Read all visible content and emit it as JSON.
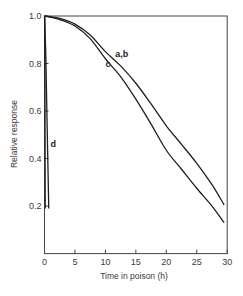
{
  "chart_data": {
    "type": "line",
    "title": "",
    "xlabel": "Time in poison (h)",
    "ylabel": "Relative response",
    "xlim": [
      0,
      30
    ],
    "ylim": [
      0,
      1.0
    ],
    "xticks": [
      0,
      5,
      10,
      15,
      20,
      25,
      30
    ],
    "xtick_labels": [
      "0",
      "5",
      "10",
      "15",
      "20",
      "25",
      "30"
    ],
    "yticks": [
      0.2,
      0.4,
      0.6,
      0.8,
      1.0
    ],
    "ytick_labels": [
      "0.2",
      "0.4",
      "0.6",
      "0.8",
      "1.0"
    ],
    "grid": false,
    "legend": "none (curves labelled inline)",
    "series": [
      {
        "name": "a,b",
        "x": [
          0,
          2.5,
          5,
          7.5,
          10,
          12.5,
          15,
          17.5,
          20,
          22.5,
          25,
          27.5,
          29.5
        ],
        "values": [
          1.0,
          0.99,
          0.966,
          0.92,
          0.85,
          0.79,
          0.717,
          0.63,
          0.538,
          0.46,
          0.38,
          0.29,
          0.205
        ],
        "label_pos": {
          "x": 11.6,
          "y": 0.84
        }
      },
      {
        "name": "c",
        "x": [
          0,
          2.5,
          5,
          7.5,
          10,
          12.5,
          15,
          17.5,
          20,
          22.5,
          25,
          27.5,
          29.5
        ],
        "values": [
          1.0,
          0.985,
          0.958,
          0.905,
          0.82,
          0.745,
          0.65,
          0.545,
          0.435,
          0.355,
          0.275,
          0.2,
          0.13
        ],
        "label_pos": {
          "x": 10.0,
          "y": 0.8
        }
      },
      {
        "name": "d",
        "x": [
          0,
          0.2,
          0.5,
          0.7
        ],
        "values": [
          1.0,
          0.85,
          0.45,
          0.19
        ],
        "label_pos": {
          "x": 1.0,
          "y": 0.46
        }
      }
    ]
  },
  "labels": {
    "xlabel": "Time in poison (h)",
    "ylabel": "Relative response",
    "curve_ab": "a,b",
    "curve_c": "c",
    "curve_d": "d"
  }
}
